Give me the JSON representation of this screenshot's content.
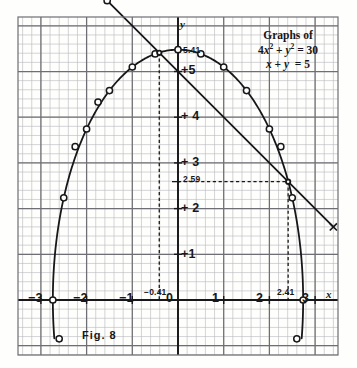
{
  "figure": {
    "caption": "Fig. 8",
    "legend": {
      "title": "Graphs of",
      "eq1": "4x² + y² = 30",
      "eq2": "x + y = 5"
    }
  },
  "axes": {
    "x_name": "x",
    "y_name": "y",
    "x_ticks": [
      {
        "v": -3,
        "label": "−3"
      },
      {
        "v": -2,
        "label": "−2"
      },
      {
        "v": -1,
        "label": "−1"
      },
      {
        "v": 0,
        "label": "0"
      },
      {
        "v": 1,
        "label": "1"
      },
      {
        "v": 2,
        "label": "2"
      },
      {
        "v": 3,
        "label": "3"
      }
    ],
    "y_ticks": [
      {
        "v": 5,
        "label": "+5"
      },
      {
        "v": 4,
        "label": "+ 4"
      },
      {
        "v": 3,
        "label": "+ 3"
      },
      {
        "v": 2,
        "label": "+ 2"
      },
      {
        "v": 1,
        "label": "+1"
      }
    ]
  },
  "annotations": [
    {
      "name": "y-intersection-high",
      "text": "5.41"
    },
    {
      "name": "y-intersection-low",
      "text": "2.59"
    },
    {
      "name": "x-intersection-left",
      "text": "−0.41"
    },
    {
      "name": "x-intersection-right",
      "text": "2.41"
    }
  ],
  "colors": {
    "ink": "#17171a",
    "grid_minor": "#b9b9bd",
    "grid_major": "#6e6e74",
    "paper": "#fefefc"
  },
  "chart_data": {
    "type": "line",
    "xlabel": "x",
    "ylabel": "y",
    "xlim": [
      -3.5,
      3.6
    ],
    "ylim": [
      -0.85,
      6.9
    ],
    "grid": true,
    "legend_position": "top-right",
    "series": [
      {
        "name": "4x² + y² = 30",
        "type": "ellipse",
        "equation": "4x^2 + y^2 = 30",
        "semi_axis_x": 2.7386,
        "semi_axis_y": 5.4772,
        "marker": "open-circle",
        "upper_branch": [
          {
            "x": -2.7386,
            "y": 0.0
          },
          {
            "x": -2.5,
            "y": 2.2361
          },
          {
            "x": -2.25,
            "y": 3.3541
          },
          {
            "x": -2.0,
            "y": 3.7417
          },
          {
            "x": -1.75,
            "y": 4.3301
          },
          {
            "x": -1.5,
            "y": 4.5826
          },
          {
            "x": -1.0,
            "y": 5.099
          },
          {
            "x": -0.5,
            "y": 5.3852
          },
          {
            "x": 0.0,
            "y": 5.4772
          },
          {
            "x": 0.5,
            "y": 5.3852
          },
          {
            "x": 1.0,
            "y": 5.099
          },
          {
            "x": 1.5,
            "y": 4.5826
          },
          {
            "x": 2.0,
            "y": 3.7417
          },
          {
            "x": 2.25,
            "y": 3.3541
          },
          {
            "x": 2.5,
            "y": 2.2361
          },
          {
            "x": 2.7386,
            "y": 0.0
          }
        ],
        "lower_tail_points": [
          {
            "x": -2.6,
            "y": -0.85
          },
          {
            "x": 2.6,
            "y": -0.85
          }
        ]
      },
      {
        "name": "x + y = 5",
        "type": "line",
        "equation": "x + y = 5",
        "slope": -1,
        "intercept": 5,
        "marker": "open-circle",
        "endpoints": [
          {
            "x": -1.55,
            "y": 6.55
          },
          {
            "x": 3.4,
            "y": 1.6
          }
        ],
        "plotted_points": [
          {
            "x": -1.55,
            "y": 6.55
          },
          {
            "x": 3.4,
            "y": 1.6
          }
        ]
      }
    ],
    "intersections": [
      {
        "x": -0.41,
        "y": 5.41,
        "x_label": "−0.41",
        "y_label": "5.41"
      },
      {
        "x": 2.41,
        "y": 2.59,
        "x_label": "2.41",
        "y_label": "2.59"
      }
    ]
  }
}
